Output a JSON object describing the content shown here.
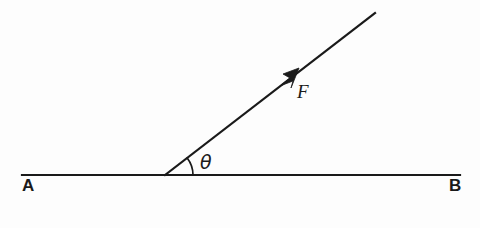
{
  "figure": {
    "background_color": "#fdfdfd",
    "ink_color": "#1a1a1a",
    "baseline": {
      "name": "line-ab",
      "start_label": "A",
      "end_label": "B",
      "x1": 22,
      "y1": 175,
      "x2": 460,
      "y2": 175,
      "stroke_width": 2.2
    },
    "ray": {
      "name": "force-vector",
      "label": "F",
      "origin_x": 165,
      "origin_y": 175,
      "tip_x": 375,
      "tip_y": 13,
      "stroke_width": 2.2,
      "angle_degrees": 37.6,
      "arrowhead_x": 298,
      "arrowhead_y": 70
    },
    "angle": {
      "name": "angle-theta",
      "label": "θ",
      "vertex_x": 165,
      "vertex_y": 175,
      "arc_radius": 28,
      "arc_stroke_width": 1.6,
      "value_degrees": 37.6
    },
    "labels": {
      "point_a": "A",
      "point_b": "B",
      "force": "F",
      "theta": "θ"
    }
  }
}
